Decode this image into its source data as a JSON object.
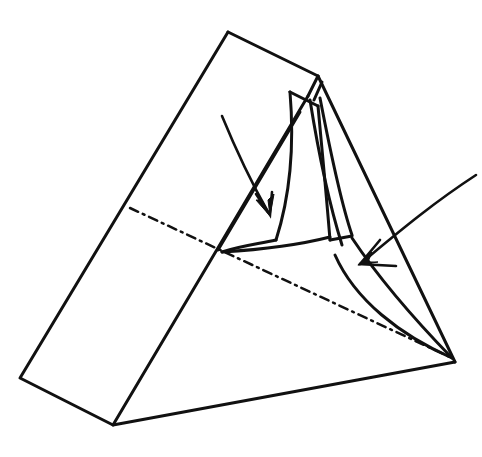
{
  "diagram": {
    "colors": {
      "stroke": "#111111",
      "background": "#ffffff"
    },
    "outline": {
      "top": [
        228,
        32
      ],
      "top_right": [
        318,
        76
      ],
      "right_tip": [
        455,
        362
      ],
      "bottom": [
        113,
        425
      ],
      "left": [
        20,
        378
      ],
      "mid_left": [
        130,
        208
      ]
    },
    "crease_line": {
      "from": [
        130,
        208
      ],
      "to": [
        452,
        358
      ],
      "style": "dash-dot"
    },
    "arrows": [
      {
        "name": "arrow-into-flap",
        "path": "M222,116 C236,150 250,180 268,212",
        "head": [
          268,
          214
        ]
      },
      {
        "name": "arrow-from-right",
        "path": "M475,175 C430,205 395,235 362,262",
        "head": [
          360,
          264
        ]
      }
    ]
  }
}
